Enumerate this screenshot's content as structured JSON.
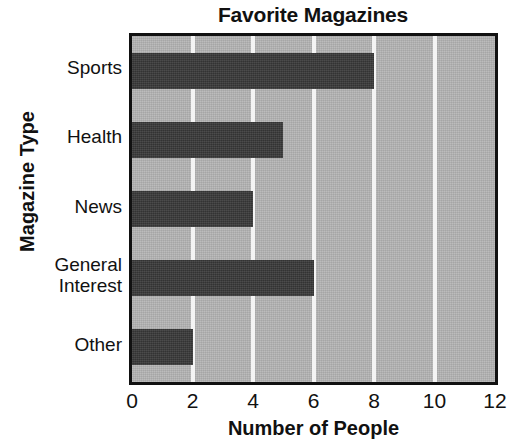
{
  "chart_data": {
    "type": "bar",
    "orientation": "horizontal",
    "title": "Favorite Magazines",
    "xlabel": "Number of People",
    "ylabel": "Magazine Type",
    "categories": [
      "Sports",
      "Health",
      "News",
      "General\nInterest",
      "Other"
    ],
    "values": [
      8,
      5,
      4,
      6,
      2
    ],
    "xlim": [
      0,
      12
    ],
    "xticks": [
      0,
      2,
      4,
      6,
      8,
      10,
      12
    ],
    "xtick_labels": [
      "0",
      "2",
      "4",
      "6",
      "8",
      "10",
      "12"
    ],
    "grid": "vertical-only",
    "legend": "none",
    "colors": {
      "bar": "#3a3a3a",
      "plot_background": "#b4b4b4",
      "gridline": "#f4f4f4",
      "axis": "#111111",
      "text": "#111111",
      "page_background": "#ffffff"
    }
  }
}
